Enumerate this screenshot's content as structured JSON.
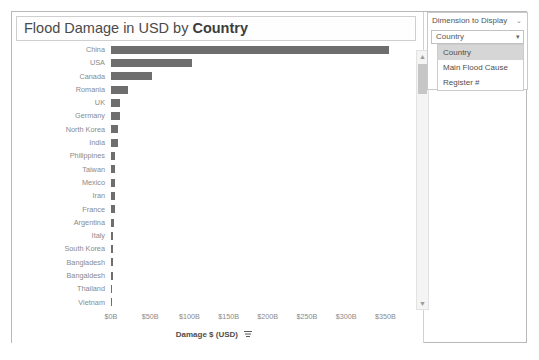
{
  "chart": {
    "title_prefix": "Flood Damage in USD by ",
    "title_dimension": "Country",
    "x_axis_title": "Damage $ (USD)",
    "sort_icon": "sort-descending-icon",
    "scrollbar": {
      "up_arrow": "▲",
      "down_arrow": "▼"
    }
  },
  "dimension_panel": {
    "header": "Dimension to Display",
    "header_caret": "⌄",
    "selected_value": "Country",
    "select_caret": "▾",
    "options": [
      {
        "label": "Country",
        "selected": true
      },
      {
        "label": "Main Flood Cause",
        "selected": false
      },
      {
        "label": "Register #",
        "selected": false
      }
    ]
  },
  "chart_data": {
    "type": "bar",
    "orientation": "horizontal",
    "title": "Flood Damage in USD by Country",
    "xlabel": "Damage $ (USD)",
    "ylabel": "",
    "xlim": [
      0,
      370
    ],
    "xtick_labels": [
      "$0B",
      "$50B",
      "$100B",
      "$150B",
      "$200B",
      "$250B",
      "$300B",
      "$350B"
    ],
    "xtick_values": [
      0,
      50,
      100,
      150,
      200,
      250,
      300,
      350
    ],
    "unit": "billion USD",
    "grid": false,
    "legend": false,
    "bar_color": "#6e6e6e",
    "sorted": "descending",
    "categories": [
      "China",
      "USA",
      "Canada",
      "Romania",
      "UK",
      "Germany",
      "North Korea",
      "India",
      "Philippines",
      "Taiwan",
      "Mexico",
      "Iran",
      "France",
      "Argentina",
      "Italy",
      "South Korea",
      "Bangladesh",
      "Bangaldesh",
      "Thailand",
      "Vietnam"
    ],
    "values": [
      355,
      103,
      52,
      22,
      11,
      11,
      9,
      9,
      5,
      5,
      5,
      5,
      5,
      4,
      3,
      2,
      2,
      2,
      1,
      1
    ]
  }
}
